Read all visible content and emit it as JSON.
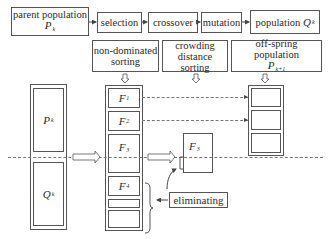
{
  "top_flow": {
    "parent_population": {
      "label": "parent population",
      "symbol": "P",
      "subscript": "k"
    },
    "selection": "selection",
    "crossover": "crossover",
    "mutation": "mutation",
    "population_q": {
      "label": "population",
      "symbol": "Q",
      "subscript": "k"
    }
  },
  "stages": {
    "non_dominated": {
      "line1": "non-dominated",
      "line2": "sorting"
    },
    "crowding": {
      "line1": "crowding",
      "line2": "distance sorting"
    },
    "offspring": {
      "label": "off-spring population",
      "symbol": "P",
      "subscript": "k+1"
    }
  },
  "combined_population": {
    "p": {
      "symbol": "P",
      "subscript": "k"
    },
    "q": {
      "symbol": "Q",
      "subscript": "k"
    }
  },
  "fronts": [
    {
      "symbol": "F",
      "subscript": "1"
    },
    {
      "symbol": "F",
      "subscript": "2"
    },
    {
      "symbol": "F",
      "subscript": "3"
    },
    {
      "symbol": "F",
      "subscript": "4"
    }
  ],
  "crowding_front": {
    "symbol": "F",
    "subscript": "3"
  },
  "eliminating_label": "eliminating"
}
